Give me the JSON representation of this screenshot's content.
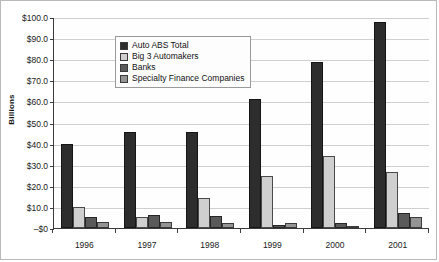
{
  "chart_data": {
    "type": "bar",
    "title": "",
    "xlabel": "",
    "ylabel": "Billions",
    "categories": [
      "1996",
      "1997",
      "1998",
      "1999",
      "2000",
      "2001"
    ],
    "series": [
      {
        "name": "Auto ABS Total",
        "color": "#2d2d2d",
        "values": [
          40.0,
          45.5,
          45.5,
          61.0,
          78.5,
          97.5
        ]
      },
      {
        "name": "Big 3 Automakers",
        "color": "#cfcfcf",
        "values": [
          10.0,
          5.0,
          14.0,
          24.5,
          34.0,
          26.5
        ]
      },
      {
        "name": "Banks",
        "color": "#5a5a5a",
        "values": [
          5.0,
          6.0,
          5.5,
          1.5,
          2.5,
          7.0
        ]
      },
      {
        "name": "Specialty Finance Companies",
        "color": "#949494",
        "values": [
          3.0,
          3.0,
          2.5,
          2.5,
          1.0,
          5.0
        ]
      }
    ],
    "ylim": [
      0,
      100
    ],
    "yticks": [
      {
        "value": 100,
        "label": "$100.0"
      },
      {
        "value": 90,
        "label": "$90.0"
      },
      {
        "value": 80,
        "label": "$80.0"
      },
      {
        "value": 70,
        "label": "$70.0"
      },
      {
        "value": 60,
        "label": "$60.0"
      },
      {
        "value": 50,
        "label": "$50.0"
      },
      {
        "value": 40,
        "label": "$40.0"
      },
      {
        "value": 30,
        "label": "$30.0"
      },
      {
        "value": 20,
        "label": "$20.0"
      },
      {
        "value": 10,
        "label": "$10.0"
      },
      {
        "value": 0,
        "label": "–$0"
      }
    ],
    "grid": true,
    "legend_position": "top-left"
  }
}
